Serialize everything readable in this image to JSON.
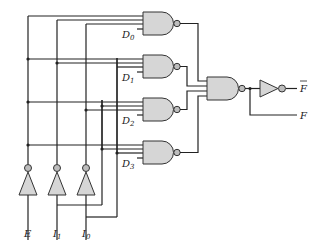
{
  "diagram": {
    "type": "logic-circuit",
    "inputs": [
      {
        "name": "E",
        "label": "E",
        "sub": ""
      },
      {
        "name": "I1",
        "label": "I",
        "sub": "1"
      },
      {
        "name": "I0",
        "label": "I",
        "sub": "0"
      }
    ],
    "data_inputs": [
      {
        "label": "D",
        "sub": "0"
      },
      {
        "label": "D",
        "sub": "1"
      },
      {
        "label": "D",
        "sub": "2"
      },
      {
        "label": "D",
        "sub": "3"
      }
    ],
    "outputs": [
      {
        "label": "F",
        "inverted": true
      },
      {
        "label": "F",
        "inverted": false
      }
    ],
    "gates": [
      {
        "id": "nand-d0",
        "type": "NAND",
        "inputs": 4
      },
      {
        "id": "nand-d1",
        "type": "NAND",
        "inputs": 4
      },
      {
        "id": "nand-d2",
        "type": "NAND",
        "inputs": 4
      },
      {
        "id": "nand-d3",
        "type": "NAND",
        "inputs": 4
      },
      {
        "id": "nand-out",
        "type": "NAND",
        "inputs": 4
      },
      {
        "id": "not-out",
        "type": "NOT",
        "inputs": 1
      },
      {
        "id": "not-e",
        "type": "NOT",
        "inputs": 1
      },
      {
        "id": "not-i1",
        "type": "NOT",
        "inputs": 1
      },
      {
        "id": "not-i0",
        "type": "NOT",
        "inputs": 1
      }
    ]
  }
}
